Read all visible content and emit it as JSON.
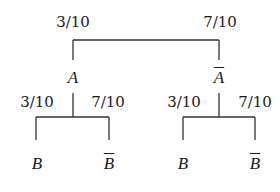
{
  "diagram": {
    "type": "probability-tree",
    "level1": {
      "branches": [
        {
          "probability": "3/10",
          "event": "A",
          "complement": false
        },
        {
          "probability": "7/10",
          "event": "A",
          "complement": true
        }
      ]
    },
    "level2": {
      "left_subtree": {
        "parent": "A",
        "branches": [
          {
            "probability": "3/10",
            "event": "B",
            "complement": false
          },
          {
            "probability": "7/10",
            "event": "B",
            "complement": true
          }
        ]
      },
      "right_subtree": {
        "parent": "A-bar",
        "branches": [
          {
            "probability": "3/10",
            "event": "B",
            "complement": false
          },
          {
            "probability": "7/10",
            "event": "B",
            "complement": true
          }
        ]
      }
    },
    "colors": {
      "line": "#333333",
      "text": "#1a1a1a",
      "background": "#ffffff"
    }
  }
}
